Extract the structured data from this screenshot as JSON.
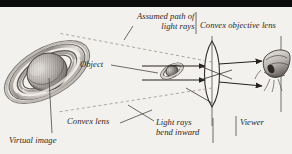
{
  "figure": {
    "background_color": "#f3f1ee",
    "ink_color": "#2b2725",
    "top_bar_color": "#0c0c0c",
    "labels": {
      "assumed_path_line1": "Assumed path of",
      "assumed_path_line2": "light rays",
      "convex_objective_lens": "Convex objective lens",
      "object": "Object",
      "convex_lens": "Convex lens",
      "light_rays_line1": "Light rays",
      "light_rays_line2": "bend inward",
      "viewer": "Viewer",
      "virtual_image": "Virtual image"
    },
    "elements": {
      "virtual_image_planet": "saturn-large",
      "object_planet": "saturn-small",
      "objective_lens": "convex-lens-shape",
      "eyepiece_lens": "convex-lens-shape",
      "viewer_eye": "eye-drawing",
      "solid_rays": "light-ray-arrows",
      "dashed_rays": "assumed-path-dashed-lines",
      "leader_lines": "label-pointer-lines"
    },
    "ray_arrow_count": 4,
    "dashed_line_count": 2
  }
}
